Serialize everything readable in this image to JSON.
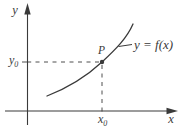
{
  "colors": {
    "ink": "#3a3a3a",
    "background": "#ffffff"
  },
  "diagram": {
    "y_axis_label": "y",
    "x_axis_label": "x",
    "curve_label": "y = f(x)",
    "point_label": "P",
    "y0_label": {
      "base": "y",
      "sub": "0"
    },
    "x0_label": {
      "base": "x",
      "sub": "0"
    }
  }
}
